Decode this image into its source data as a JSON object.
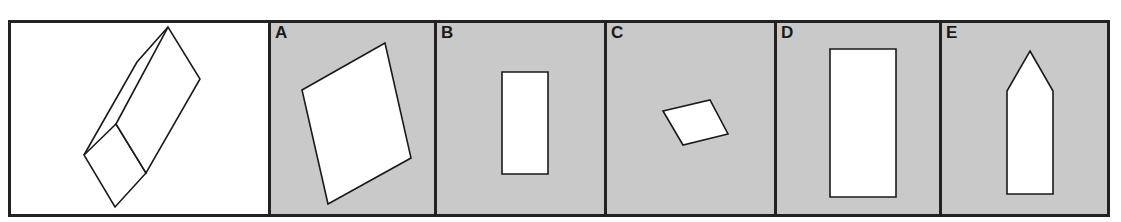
{
  "puzzle": {
    "type": "3D shape cross-section / face identification",
    "prompt_figure": {
      "description": "Oblique view of a long rectangular prism (box) with a square end face",
      "icon": "rectangular-prism-3d"
    },
    "options": [
      {
        "label": "A",
        "shape": "tilted-parallelogram",
        "description": "Large tilted quadrilateral"
      },
      {
        "label": "B",
        "shape": "tall-rectangle-small",
        "description": "Small upright rectangle"
      },
      {
        "label": "C",
        "shape": "small-parallelogram",
        "description": "Small tilted rhombus"
      },
      {
        "label": "D",
        "shape": "tall-rectangle-large",
        "description": "Large upright rectangle"
      },
      {
        "label": "E",
        "shape": "pentagon-arrow",
        "description": "Upright rectangle with pointed top (pentagon)"
      }
    ]
  },
  "colors": {
    "border": "#222222",
    "option_background": "#c9c9c9",
    "prompt_background": "#ffffff",
    "shape_fill": "#ffffff",
    "shape_stroke": "#1a1a1a"
  }
}
